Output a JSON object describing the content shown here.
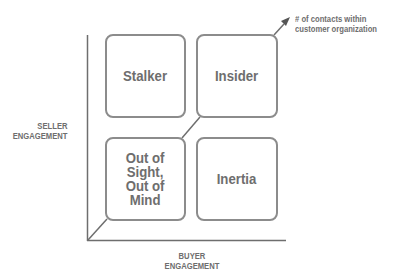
{
  "diagram": {
    "type": "2x2 matrix",
    "y_axis_label": [
      "SELLER",
      "ENGAGEMENT"
    ],
    "x_axis_label": [
      "BUYER",
      "ENGAGEMENT"
    ],
    "diagonal_arrow_label": [
      "# of contacts within",
      "customer organization"
    ],
    "quadrants": {
      "top_left": "Stalker",
      "top_right": "Insider",
      "bottom_left": [
        "Out of",
        "Sight,",
        "Out of",
        "Mind"
      ],
      "bottom_right": "Inertia"
    },
    "colors": {
      "line": "#6e6e6e",
      "box_border": "#8c8c8c",
      "text": "#6e6e6e",
      "background": "#ffffff"
    }
  }
}
